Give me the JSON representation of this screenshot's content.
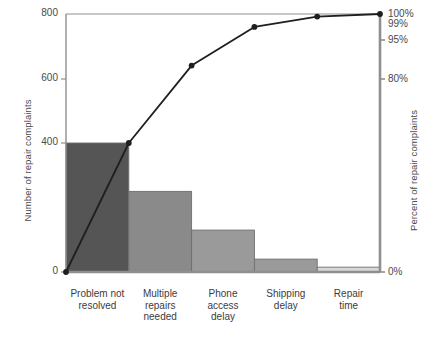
{
  "chart_data": {
    "type": "bar",
    "title": "",
    "xlabel": "",
    "ylabel": "Number of repair complaints",
    "ylabel_right": "Percent of repair complaints",
    "categories": [
      "Problem not\nresolved",
      "Multiple\nrepairs\nneeded",
      "Phone\naccess\ndelay",
      "Shipping\ndelay",
      "Repair\ntime"
    ],
    "values": [
      400,
      250,
      130,
      40,
      15
    ],
    "cumulative_percent": [
      50,
      80,
      95,
      99,
      100
    ],
    "ylim": [
      0,
      800
    ],
    "ylim_right": [
      0,
      100
    ],
    "yticks": [
      0,
      400,
      600,
      800
    ],
    "ytick_labels": [
      "0",
      "400",
      "600",
      "800"
    ],
    "yticks_right": [
      0,
      80,
      95,
      99,
      100
    ],
    "ytick_labels_right": [
      "0%",
      "80%",
      "95%",
      "99%",
      "100%"
    ],
    "grid": false,
    "legend": "none",
    "bar_colors": [
      "#555555",
      "#8a8a8a",
      "#9a9a9a",
      "#9a9a9a",
      "#d8d8d8"
    ],
    "line_color": "#1f1f1f",
    "marker_color": "#1f1f1f",
    "axis_color": "#8f8f8f"
  },
  "axes": {
    "left_title": "Number of repair complaints",
    "right_title": "Percent of repair complaints",
    "left_ticks": [
      {
        "label": "800",
        "y": 14
      },
      {
        "label": "600",
        "y": 79
      },
      {
        "label": "400",
        "y": 143
      },
      {
        "label": "0",
        "y": 272
      }
    ],
    "right_ticks": [
      {
        "label": "100%",
        "y": 14
      },
      {
        "label": "99%",
        "y": 24
      },
      {
        "label": "95%",
        "y": 40
      },
      {
        "label": "80%",
        "y": 79
      },
      {
        "label": "0%",
        "y": 272
      }
    ]
  }
}
